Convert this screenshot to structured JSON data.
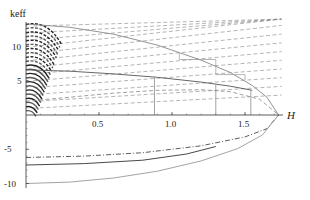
{
  "chart_data": {
    "type": "line",
    "title": "",
    "xlabel": "H",
    "ylabel": "keff",
    "xlim": [
      0,
      1.8
    ],
    "ylim": [
      -10.5,
      13.5
    ],
    "x_ticks": [
      0.5,
      1.0,
      1.5
    ],
    "x_tick_labels": [
      "0.5",
      "1.0",
      "1.5"
    ],
    "y_ticks": [
      -10,
      -5,
      5,
      10
    ],
    "y_tick_labels": [
      "-10",
      "-5",
      "5",
      "10"
    ],
    "grid": false,
    "legend": null,
    "H_max": 1.73,
    "series": [
      {
        "name": "upper envelope (solid)",
        "style": "solid",
        "color": "#888888",
        "x": [
          0,
          0.3,
          0.6,
          0.9,
          1.2,
          1.4,
          1.55,
          1.65,
          1.73
        ],
        "y": [
          13.3,
          12.8,
          11.8,
          10.2,
          8.0,
          6.2,
          4.3,
          2.6,
          0
        ]
      },
      {
        "name": "inner solid",
        "style": "solid",
        "color": "#555555",
        "x": [
          0,
          0.3,
          0.6,
          0.9,
          1.2,
          1.4,
          1.55
        ],
        "y": [
          6.6,
          6.4,
          6.0,
          5.5,
          4.8,
          4.2,
          3.6
        ]
      },
      {
        "name": "lower dashed arc",
        "style": "dashed",
        "color": "#888888",
        "x": [
          0,
          0.3,
          0.6,
          0.9,
          1.2,
          1.4,
          1.6,
          1.73
        ],
        "y": [
          2.0,
          2.6,
          3.2,
          3.6,
          3.7,
          3.4,
          2.3,
          0
        ]
      },
      {
        "name": "negative branch dash-dot",
        "style": "dashdot",
        "color": "#333333",
        "x": [
          0,
          0.4,
          0.8,
          1.2,
          1.5,
          1.65,
          1.73
        ],
        "y": [
          -6.2,
          -6.0,
          -5.5,
          -4.5,
          -3.2,
          -2.0,
          0
        ]
      },
      {
        "name": "negative branch solid",
        "style": "solid",
        "color": "#333333",
        "x": [
          0,
          0.4,
          0.8,
          1.1,
          1.3
        ],
        "y": [
          -7.3,
          -7.1,
          -6.6,
          -5.7,
          -4.6
        ]
      },
      {
        "name": "negative branch lower envelope",
        "style": "solid",
        "color": "#999999",
        "x": [
          0,
          0.3,
          0.6,
          0.9,
          1.2,
          1.45,
          1.62,
          1.73
        ],
        "y": [
          -10.0,
          -9.8,
          -9.2,
          -8.2,
          -6.7,
          -4.9,
          -2.9,
          0
        ]
      }
    ],
    "dashed_family": {
      "description": "family of dashed rising lines starting near H=0 with increasing keff",
      "start_y": [
        1,
        2,
        3,
        4,
        5,
        6,
        7,
        8,
        9,
        10,
        11,
        12,
        13
      ],
      "slope": 3.2,
      "x_end": 1.75
    },
    "vertical_markers": [
      {
        "x": 0.88,
        "y_top": 5.6
      },
      {
        "x": 1.3,
        "y_top": 4.5
      },
      {
        "x": 1.54,
        "y_top": 3.7
      }
    ],
    "step_segments": [
      {
        "x": [
          1.05,
          1.05,
          1.3,
          1.3
        ],
        "y": [
          9.0,
          8.1,
          8.1,
          6.9
        ]
      },
      {
        "x": [
          1.3,
          1.3,
          1.5,
          1.5
        ],
        "y": [
          6.9,
          5.9,
          5.9,
          5.1
        ]
      }
    ]
  },
  "axes": {
    "x_label": "H",
    "y_label": "keff"
  }
}
